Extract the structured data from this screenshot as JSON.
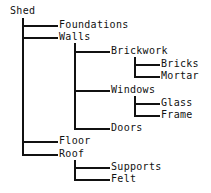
{
  "diagram": {
    "type": "tree",
    "root": {
      "label": "Shed",
      "children": [
        {
          "label": "Foundations",
          "children": []
        },
        {
          "label": "Walls",
          "children": [
            {
              "label": "Brickwork",
              "children": [
                {
                  "label": "Bricks",
                  "children": []
                },
                {
                  "label": "Mortar",
                  "children": []
                }
              ]
            },
            {
              "label": "Windows",
              "children": [
                {
                  "label": "Glass",
                  "children": []
                },
                {
                  "label": "Frame",
                  "children": []
                }
              ]
            },
            {
              "label": "Doors",
              "children": []
            }
          ]
        },
        {
          "label": "Floor",
          "children": []
        },
        {
          "label": "Roof",
          "children": [
            {
              "label": "Supports",
              "children": []
            },
            {
              "label": "Felt",
              "children": []
            }
          ]
        }
      ]
    },
    "line_color": "#111111",
    "text_color": "#111111",
    "background": "#ffffff"
  },
  "labels": {
    "shed": "Shed",
    "foundations": "Foundations",
    "walls": "Walls",
    "brickwork": "Brickwork",
    "bricks": "Bricks",
    "mortar": "Mortar",
    "windows": "Windows",
    "glass": "Glass",
    "frame": "Frame",
    "doors": "Doors",
    "floor": "Floor",
    "roof": "Roof",
    "supports": "Supports",
    "felt": "Felt"
  }
}
